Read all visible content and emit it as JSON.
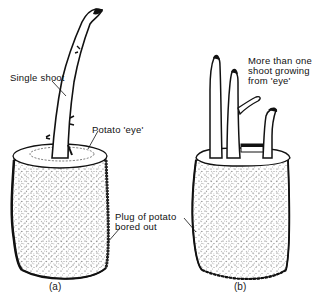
{
  "figure": {
    "panels": [
      {
        "id": "a",
        "caption": "(a)",
        "labels": {
          "shoot": "Single shoot",
          "eye": "Potato 'eye'"
        }
      },
      {
        "id": "b",
        "caption": "(b)",
        "labels": {
          "shoots_line1": "More than one",
          "shoots_line2": "shoot growing",
          "shoots_line3": "from 'eye'"
        }
      }
    ],
    "shared_label": {
      "line1": "Plug of potato",
      "line2": "bored out"
    },
    "colors": {
      "ink": "#111111",
      "stipple": "#444444",
      "background": "#ffffff"
    }
  }
}
